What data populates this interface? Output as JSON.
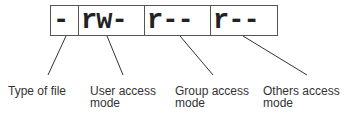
{
  "permission_string": {
    "cells": [
      {
        "text": "-",
        "role": "type"
      },
      {
        "text": "rw-",
        "role": "user"
      },
      {
        "text": "r--",
        "role": "group"
      },
      {
        "text": "r--",
        "role": "others"
      }
    ]
  },
  "labels": [
    {
      "line1": "Type of file",
      "line2": ""
    },
    {
      "line1": "User access",
      "line2": "mode"
    },
    {
      "line1": "Group access",
      "line2": "mode"
    },
    {
      "line1": "Others access",
      "line2": "mode"
    }
  ]
}
